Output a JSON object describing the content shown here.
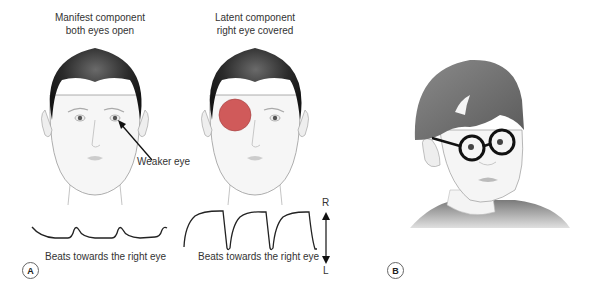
{
  "panel_a": {
    "label": "A",
    "left_face": {
      "caption_line1": "Manifest component",
      "caption_line2": "both eyes open",
      "annotation": "Weaker eye",
      "trace_caption": "Beats towards the right eye"
    },
    "right_face": {
      "caption_line1": "Latent component",
      "caption_line2": "right eye covered",
      "trace_caption": "Beats towards the right eye",
      "occluder_color": "#d05a5a"
    },
    "axis": {
      "top_label": "R",
      "bottom_label": "L"
    }
  },
  "panel_b": {
    "label": "B"
  },
  "colors": {
    "hair": "#2a2a2a",
    "skin_line": "#999999",
    "trace": "#222222",
    "occluder": "#d05a5a"
  }
}
